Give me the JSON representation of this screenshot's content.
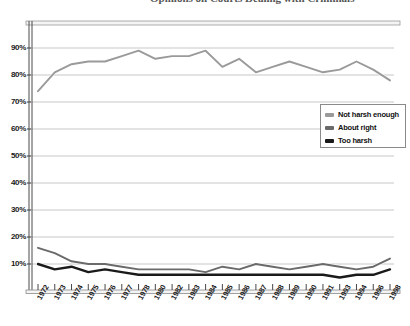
{
  "title": "Opinions on Courts Dealing with Criminals",
  "legend": {
    "items": [
      {
        "label": "Not harsh enough",
        "color": "#9a9a9a"
      },
      {
        "label": "About right",
        "color": "#6a6a6a"
      },
      {
        "label": "Too harsh",
        "color": "#1a1a1a"
      }
    ]
  },
  "axes": {
    "y_ticks": [
      "90%",
      "80%",
      "70%",
      "60%",
      "50%",
      "40%",
      "30%",
      "20%",
      "10%"
    ],
    "x_ticks": [
      "1972",
      "1973",
      "1974",
      "1975",
      "1976",
      "1977",
      "1978",
      "1980",
      "1982",
      "1983",
      "1984",
      "1985",
      "1986",
      "1987",
      "1988",
      "1989",
      "1990",
      "1991",
      "1993",
      "1994",
      "1996",
      "1998"
    ]
  },
  "chart_data": {
    "type": "line",
    "title": "Opinions on Courts Dealing with Criminals",
    "xlabel": "",
    "ylabel": "",
    "ylim": [
      0,
      95
    ],
    "yticks": [
      10,
      20,
      30,
      40,
      50,
      60,
      70,
      80,
      90
    ],
    "grid": true,
    "legend_position": "right",
    "categories": [
      "1972",
      "1973",
      "1974",
      "1975",
      "1976",
      "1977",
      "1978",
      "1980",
      "1982",
      "1983",
      "1984",
      "1985",
      "1986",
      "1987",
      "1988",
      "1989",
      "1990",
      "1991",
      "1993",
      "1994",
      "1996",
      "1998"
    ],
    "series": [
      {
        "name": "Not harsh enough",
        "color": "#9a9a9a",
        "values": [
          74,
          81,
          84,
          85,
          85,
          87,
          89,
          86,
          87,
          87,
          89,
          83,
          86,
          81,
          83,
          85,
          83,
          81,
          82,
          85,
          82,
          78
        ]
      },
      {
        "name": "About right",
        "color": "#6a6a6a",
        "values": [
          16,
          14,
          11,
          10,
          10,
          9,
          8,
          8,
          8,
          8,
          7,
          9,
          8,
          10,
          9,
          8,
          9,
          10,
          9,
          8,
          9,
          12
        ]
      },
      {
        "name": "Too harsh",
        "color": "#1a1a1a",
        "values": [
          10,
          8,
          9,
          7,
          8,
          7,
          6,
          6,
          6,
          6,
          6,
          6,
          6,
          6,
          6,
          6,
          6,
          6,
          5,
          6,
          6,
          8
        ]
      }
    ]
  }
}
